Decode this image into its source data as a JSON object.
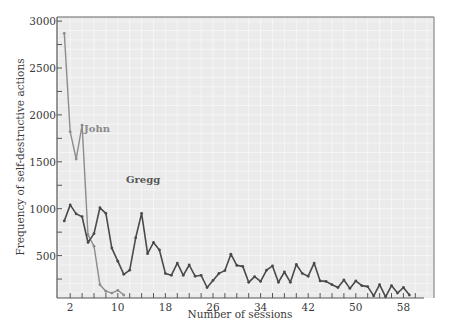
{
  "chart_data": {
    "type": "line",
    "title": "",
    "xlabel": "Number of sessions",
    "ylabel": "Frequency of self-destructive actions",
    "xlim": [
      0,
      62
    ],
    "ylim": [
      0,
      3000
    ],
    "x_ticks": [
      2,
      10,
      18,
      26,
      34,
      42,
      50,
      58
    ],
    "y_ticks": [
      500,
      1000,
      1500,
      2000,
      2500,
      3000
    ],
    "grid": true,
    "legend": "inline labels",
    "series": [
      {
        "name": "John",
        "color": "#8c8c8c",
        "x": [
          1,
          2,
          3,
          4,
          5,
          6,
          7,
          8,
          9,
          10,
          11
        ],
        "values": [
          2870,
          1820,
          1530,
          1890,
          720,
          600,
          190,
          120,
          100,
          130,
          80
        ]
      },
      {
        "name": "Gregg",
        "color": "#4a4a4a",
        "x": [
          1,
          2,
          3,
          4,
          5,
          6,
          7,
          8,
          9,
          10,
          11,
          12,
          13,
          14,
          15,
          16,
          17,
          18,
          19,
          20,
          21,
          22,
          23,
          24,
          25,
          26,
          27,
          28,
          29,
          30,
          31,
          32,
          33,
          34,
          35,
          36,
          37,
          38,
          39,
          40,
          41,
          42,
          43,
          44,
          45,
          46,
          47,
          48,
          49,
          50,
          51,
          52,
          53,
          54,
          55,
          56,
          57,
          58,
          59
        ],
        "values": [
          870,
          1040,
          945,
          915,
          640,
          735,
          1010,
          950,
          580,
          440,
          300,
          345,
          690,
          950,
          520,
          640,
          560,
          310,
          290,
          420,
          290,
          400,
          280,
          290,
          160,
          235,
          310,
          340,
          515,
          395,
          385,
          215,
          275,
          225,
          345,
          390,
          215,
          325,
          215,
          405,
          310,
          280,
          420,
          230,
          225,
          190,
          160,
          240,
          150,
          230,
          180,
          170,
          70,
          190,
          60,
          180,
          100,
          160,
          80
        ]
      }
    ]
  },
  "labels": {
    "john": "John",
    "gregg": "Gregg",
    "xlabel": "Number of sessions",
    "ylabel": "Frequency of self-destructive actions"
  },
  "colors": {
    "plot_background": "#ebebeb",
    "grid": "#f7f7f7",
    "axis": "#555555",
    "john_line": "#8c8c8c",
    "gregg_line": "#4a4a4a"
  }
}
